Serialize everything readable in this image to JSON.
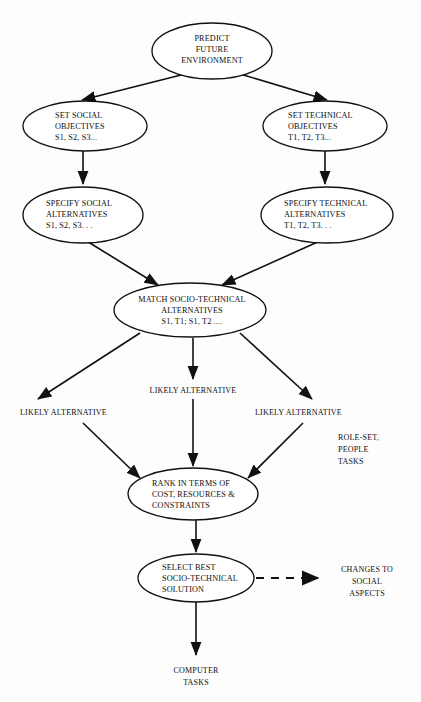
{
  "diagram": {
    "background_color": "#fdfdfd",
    "line_color": "#111111",
    "text_color": "#0d0d0d",
    "nodes": [
      {
        "id": "predict-future-environment",
        "shape": "ellipse",
        "align": "center",
        "cx": 212,
        "cy": 51,
        "rx": 60,
        "ry": 28,
        "lines": [
          "PREDICT",
          "FUTURE",
          "ENVIRONMENT"
        ]
      },
      {
        "id": "set-social-objectives",
        "shape": "ellipse",
        "align": "left",
        "cx": 85,
        "cy": 126,
        "rx": 62,
        "ry": 25,
        "lines": [
          "SET SOCIAL",
          "OBJECTIVES",
          "S1, S2, S3..."
        ]
      },
      {
        "id": "set-technical-objectives",
        "shape": "ellipse",
        "align": "left",
        "cx": 325,
        "cy": 126,
        "rx": 62,
        "ry": 25,
        "lines": [
          "SET TECHNICAL",
          "OBJECTIVES",
          "T1, T2, T3..."
        ]
      },
      {
        "id": "specify-social-alternatives",
        "shape": "ellipse",
        "align": "left",
        "cx": 83,
        "cy": 215,
        "rx": 60,
        "ry": 28,
        "lines": [
          "SPECIFY SOCIAL",
          "ALTERNATIVES",
          "S1, S2, S3. . ."
        ]
      },
      {
        "id": "specify-technical-alternatives",
        "shape": "ellipse",
        "align": "left",
        "cx": 327,
        "cy": 215,
        "rx": 66,
        "ry": 28,
        "lines": [
          "SPECIFY TECHNICAL",
          "ALTERNATIVES",
          "T1, T2, T3. . ."
        ]
      },
      {
        "id": "match-socio-technical-alternatives",
        "shape": "ellipse",
        "align": "center",
        "cx": 190,
        "cy": 310,
        "rx": 76,
        "ry": 27,
        "lines": [
          "MATCH SOCIO-TECHNICAL",
          "ALTERNATIVES",
          "S1, T1; S1, T2 ...."
        ]
      },
      {
        "id": "rank-in-terms-of",
        "shape": "ellipse",
        "align": "left",
        "cx": 193,
        "cy": 494,
        "rx": 65,
        "ry": 26,
        "lines": [
          "RANK IN TERMS OF",
          "COST, RESOURCES &",
          "CONSTRAINTS"
        ]
      },
      {
        "id": "select-best-socio-technical-solution",
        "shape": "ellipse",
        "align": "left",
        "cx": 196,
        "cy": 578,
        "rx": 58,
        "ry": 24,
        "lines": [
          "SELECT BEST",
          "SOCIO-TECHNICAL",
          "SOLUTION"
        ]
      }
    ],
    "labels": [
      {
        "id": "likely-alternative-left",
        "align": "left",
        "x": 20,
        "y": 415,
        "lines": [
          "LIKELY ALTERNATIVE"
        ]
      },
      {
        "id": "likely-alternative-middle",
        "align": "center",
        "x": 193,
        "y": 393,
        "lines": [
          "LIKELY ALTERNATIVE"
        ]
      },
      {
        "id": "likely-alternative-right",
        "align": "left",
        "x": 255,
        "y": 415,
        "lines": [
          "LIKELY ALTERNATIVE"
        ]
      },
      {
        "id": "role-set-people-tasks",
        "align": "left",
        "x": 338,
        "y": 440,
        "lines": [
          "ROLE-SET,",
          "PEOPLE",
          "TASKS"
        ]
      },
      {
        "id": "changes-to-social-aspects",
        "align": "center",
        "x": 367,
        "y": 572,
        "lines": [
          "CHANGES TO",
          "SOCIAL",
          "ASPECTS"
        ]
      },
      {
        "id": "computer-tasks",
        "align": "center",
        "x": 196,
        "y": 673,
        "lines": [
          "COMPUTER",
          "TASKS"
        ]
      }
    ],
    "edges": [
      {
        "id": "predict-to-set-social",
        "style": "solid",
        "from": "predict-future-environment",
        "to": "set-social-objectives"
      },
      {
        "id": "predict-to-set-technical",
        "style": "solid",
        "from": "predict-future-environment",
        "to": "set-technical-objectives"
      },
      {
        "id": "set-social-to-specify-social",
        "style": "solid",
        "from": "set-social-objectives",
        "to": "specify-social-alternatives"
      },
      {
        "id": "set-technical-to-specify-technical",
        "style": "solid",
        "from": "set-technical-objectives",
        "to": "specify-technical-alternatives"
      },
      {
        "id": "specify-social-to-match",
        "style": "solid",
        "from": "specify-social-alternatives",
        "to": "match-socio-technical-alternatives"
      },
      {
        "id": "specify-technical-to-match",
        "style": "solid",
        "from": "specify-technical-alternatives",
        "to": "match-socio-technical-alternatives"
      },
      {
        "id": "match-to-likely-left",
        "style": "solid",
        "from": "match-socio-technical-alternatives",
        "to": "likely-alternative-left"
      },
      {
        "id": "match-to-likely-middle",
        "style": "solid",
        "from": "match-socio-technical-alternatives",
        "to": "likely-alternative-middle"
      },
      {
        "id": "match-to-likely-right",
        "style": "solid",
        "from": "match-socio-technical-alternatives",
        "to": "likely-alternative-right"
      },
      {
        "id": "likely-left-to-rank",
        "style": "solid",
        "from": "likely-alternative-left",
        "to": "rank-in-terms-of"
      },
      {
        "id": "likely-middle-to-rank",
        "style": "solid",
        "from": "likely-alternative-middle",
        "to": "rank-in-terms-of"
      },
      {
        "id": "likely-right-to-rank",
        "style": "solid",
        "from": "likely-alternative-right",
        "to": "rank-in-terms-of"
      },
      {
        "id": "rank-to-select",
        "style": "solid",
        "from": "rank-in-terms-of",
        "to": "select-best-socio-technical-solution"
      },
      {
        "id": "select-to-changes",
        "style": "dashed",
        "from": "select-best-socio-technical-solution",
        "to": "changes-to-social-aspects"
      },
      {
        "id": "select-to-computer-tasks",
        "style": "solid",
        "from": "select-best-socio-technical-solution",
        "to": "computer-tasks"
      }
    ]
  }
}
